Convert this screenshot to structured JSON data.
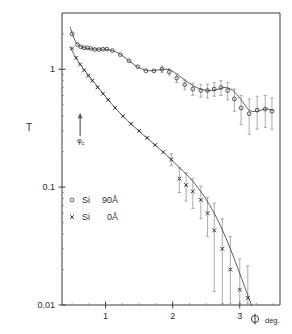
{
  "chart_data": {
    "type": "scatter",
    "title": "",
    "xlabel": "φ  deg.",
    "ylabel": "T",
    "xlim": [
      0.35,
      3.6
    ],
    "ylim": [
      0.01,
      3.0
    ],
    "yscale": "log",
    "xscale": "linear",
    "grid": false,
    "legend_position": "lower-left-inside",
    "x_ticks": [
      "1",
      "2",
      "3"
    ],
    "x_tick_values": [
      1,
      2,
      3
    ],
    "y_ticks": [
      "1",
      "0.1",
      "0.01"
    ],
    "y_tick_values": [
      1,
      0.1,
      0.01
    ],
    "annotations": [
      {
        "name": "critical-angle-arrow",
        "label": "φ",
        "sublabel": "c",
        "x": 0.62,
        "y_top": 0.42,
        "y_bottom": 0.27
      }
    ],
    "series": [
      {
        "name": "Si  90Å",
        "marker": "open-circle",
        "legend_label_material": "Si",
        "legend_label_thickness": "90Å",
        "x": [
          0.5,
          0.58,
          0.63,
          0.68,
          0.73,
          0.78,
          0.84,
          0.9,
          0.96,
          1.02,
          1.1,
          1.22,
          1.35,
          1.48,
          1.6,
          1.72,
          1.84,
          1.95,
          2.06,
          2.18,
          2.3,
          2.42,
          2.52,
          2.62,
          2.72,
          2.82,
          2.92,
          3.02,
          3.14,
          3.26,
          3.38,
          3.48
        ],
        "y": [
          2.0,
          1.62,
          1.55,
          1.52,
          1.52,
          1.5,
          1.47,
          1.47,
          1.48,
          1.48,
          1.44,
          1.33,
          1.18,
          1.05,
          0.97,
          0.97,
          1.0,
          0.95,
          0.84,
          0.74,
          0.68,
          0.66,
          0.66,
          0.68,
          0.7,
          0.66,
          0.56,
          0.47,
          0.42,
          0.45,
          0.46,
          0.44
        ],
        "yerr": [
          0,
          0,
          0,
          0,
          0,
          0,
          0,
          0,
          0,
          0,
          0,
          0,
          0,
          0,
          0,
          0,
          0.06,
          0.06,
          0.07,
          0.07,
          0.08,
          0.08,
          0.09,
          0.09,
          0.1,
          0.11,
          0.12,
          0.13,
          0.14,
          0.14,
          0.14,
          0.13
        ]
      },
      {
        "name": "Si  0Å",
        "marker": "cross",
        "legend_label_material": "Si",
        "legend_label_thickness": "0Å",
        "x": [
          0.5,
          0.56,
          0.62,
          0.68,
          0.74,
          0.8,
          0.88,
          0.96,
          1.04,
          1.14,
          1.26,
          1.38,
          1.5,
          1.62,
          1.74,
          1.86,
          1.98,
          2.1,
          2.2,
          2.3,
          2.42,
          2.52,
          2.62,
          2.74,
          2.86,
          3.0,
          3.12
        ],
        "y": [
          1.5,
          1.25,
          1.1,
          0.98,
          0.88,
          0.8,
          0.7,
          0.62,
          0.55,
          0.47,
          0.4,
          0.345,
          0.3,
          0.262,
          0.228,
          0.198,
          0.172,
          0.118,
          0.104,
          0.092,
          0.078,
          0.06,
          0.043,
          0.03,
          0.02,
          0.0135,
          0.0115
        ],
        "yerr": [
          0,
          0,
          0,
          0,
          0,
          0,
          0,
          0,
          0,
          0,
          0,
          0,
          0,
          0,
          0,
          0,
          0.02,
          0.028,
          0.028,
          0.026,
          0.024,
          0.022,
          0.03,
          0.024,
          0.018,
          0.011,
          0.01
        ]
      }
    ],
    "fit_curves": [
      {
        "name": "fit-upper",
        "for_series": "Si  90Å",
        "x": [
          0.47,
          0.52,
          0.57,
          0.62,
          0.68,
          0.75,
          0.84,
          0.95,
          1.06,
          1.18,
          1.3,
          1.42,
          1.55,
          1.68,
          1.8,
          1.9,
          2.0,
          2.12,
          2.25,
          2.38,
          2.52,
          2.65,
          2.78,
          2.9,
          3.02,
          3.14,
          3.26,
          3.38,
          3.5
        ],
        "y": [
          2.3,
          1.88,
          1.66,
          1.56,
          1.52,
          1.5,
          1.48,
          1.48,
          1.46,
          1.38,
          1.24,
          1.1,
          1.0,
          0.97,
          0.99,
          1.0,
          0.96,
          0.86,
          0.76,
          0.69,
          0.66,
          0.67,
          0.7,
          0.66,
          0.55,
          0.45,
          0.44,
          0.46,
          0.45
        ]
      },
      {
        "name": "fit-lower",
        "for_series": "Si  0Å",
        "x": [
          0.47,
          0.54,
          0.62,
          0.72,
          0.84,
          0.96,
          1.1,
          1.25,
          1.4,
          1.56,
          1.72,
          1.88,
          2.02,
          2.16,
          2.3,
          2.44,
          2.58,
          2.72,
          2.86,
          3.0,
          3.1,
          3.18
        ],
        "y": [
          1.55,
          1.3,
          1.1,
          0.93,
          0.76,
          0.625,
          0.5,
          0.405,
          0.335,
          0.278,
          0.232,
          0.193,
          0.162,
          0.136,
          0.112,
          0.088,
          0.066,
          0.046,
          0.03,
          0.0185,
          0.013,
          0.0098
        ]
      }
    ],
    "legend_entries": [
      {
        "marker": "open-circle",
        "material": "Si",
        "thickness": "90Å"
      },
      {
        "marker": "cross",
        "material": "Si",
        "thickness": "0Å"
      }
    ],
    "colors": {
      "axis": "#3a3a3a",
      "curve": "#4a4a4a",
      "marker_open": "#333333",
      "marker_cross": "#222222",
      "errorbar": "#888888",
      "text": "#2b2b2b",
      "background": "#ffffff"
    }
  }
}
